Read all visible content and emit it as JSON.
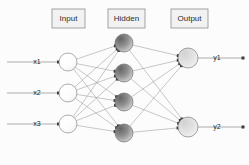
{
  "diagram": {
    "background_color": "#fcfcfd",
    "width": 249,
    "height": 165
  },
  "layer_labels": [
    {
      "id": "input",
      "text": "Input",
      "box_x": 52,
      "box_y": 9,
      "box_w": 33,
      "box_h": 19
    },
    {
      "id": "hidden",
      "text": "Hidden",
      "box_x": 108,
      "box_y": 9,
      "box_w": 37,
      "box_h": 19
    },
    {
      "id": "output",
      "text": "Output",
      "box_x": 171,
      "box_y": 9,
      "box_w": 37,
      "box_h": 19
    }
  ],
  "layers": [
    {
      "id": "input-layer",
      "name": "Input",
      "node_radius": 9,
      "node_fill": "#fbfbfb",
      "node_stroke": "#8c8c8c",
      "nodes": [
        {
          "id": "x1",
          "label": "x1",
          "cx": 68,
          "cy": 62
        },
        {
          "id": "x2",
          "label": "x2",
          "cx": 68,
          "cy": 93
        },
        {
          "id": "x3",
          "label": "x3",
          "cx": 68,
          "cy": 124
        }
      ]
    },
    {
      "id": "hidden-layer",
      "name": "Hidden",
      "node_radius": 9,
      "node_fill": "#7d7d7d",
      "node_stroke": "#6e6e6e",
      "nodes": [
        {
          "id": "h1",
          "label": "",
          "cx": 124,
          "cy": 43
        },
        {
          "id": "h2",
          "label": "",
          "cx": 124,
          "cy": 73
        },
        {
          "id": "h3",
          "label": "",
          "cx": 124,
          "cy": 102
        },
        {
          "id": "h4",
          "label": "",
          "cx": 124,
          "cy": 133
        }
      ]
    },
    {
      "id": "output-layer",
      "name": "Output",
      "node_radius": 10,
      "node_fill": "#e0e0e0",
      "node_stroke": "#7e7e7e",
      "nodes": [
        {
          "id": "y1",
          "label": "y1",
          "cx": 188,
          "cy": 58
        },
        {
          "id": "y2",
          "label": "y2",
          "cx": 188,
          "cy": 127
        }
      ]
    }
  ],
  "input_signals": [
    {
      "id": "x1",
      "label": "x1",
      "label_x": 37,
      "label_y": 62,
      "line_x1": 7,
      "line_x2": 58,
      "y": 62
    },
    {
      "id": "x2",
      "label": "x2",
      "label_x": 37,
      "label_y": 93,
      "line_x1": 7,
      "line_x2": 58,
      "y": 93
    },
    {
      "id": "x3",
      "label": "x3",
      "label_x": 37,
      "label_y": 124,
      "line_x1": 7,
      "line_x2": 58,
      "y": 124
    }
  ],
  "output_signals": [
    {
      "id": "y1",
      "label": "y1",
      "label_x": 217,
      "label_y": 58,
      "line_x1": 198,
      "line_x2": 243,
      "y": 58
    },
    {
      "id": "y2",
      "label": "y2",
      "label_x": 217,
      "label_y": 127,
      "line_x1": 198,
      "line_x2": 243,
      "y": 127
    }
  ],
  "connections": {
    "fully_connected": true,
    "input_to_hidden_count": 12,
    "hidden_to_output_count": 8,
    "edge_color": "#9a9a9a",
    "arrowhead_color": "#3a3a3a"
  },
  "colors": {
    "background": "#fcfcfd",
    "label_box_fill": "#f2f2f2",
    "label_box_stroke": "#8e8e8e",
    "text": "#2b2b2b",
    "edge": "#9a9a9a"
  }
}
